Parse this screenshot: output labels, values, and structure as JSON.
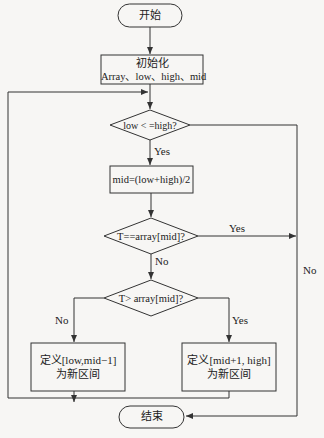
{
  "nodes": {
    "start": {
      "label": "开始"
    },
    "init": {
      "line1": "初始化",
      "line2": "Array、low、high、mid"
    },
    "cond_loop": {
      "label": "low < =high?"
    },
    "compute_mid": {
      "label": "mid=(low+high)/2"
    },
    "cond_equal": {
      "label": "T==array[mid]?"
    },
    "cond_greater": {
      "label": "T> array[mid]?"
    },
    "left_interval": {
      "line1": "定义[low,mid−1]",
      "line2": "为新区间"
    },
    "right_interval": {
      "line1": "定义[mid+1, high]",
      "line2": "为新区间"
    },
    "end": {
      "label": "结束"
    }
  },
  "edges": {
    "loop_yes": "Yes",
    "loop_no": "No",
    "equal_yes": "Yes",
    "equal_no": "No",
    "greater_no": "No",
    "greater_yes": "Yes"
  },
  "colors": {
    "line": "#333333",
    "background": "#f7f6f4"
  }
}
